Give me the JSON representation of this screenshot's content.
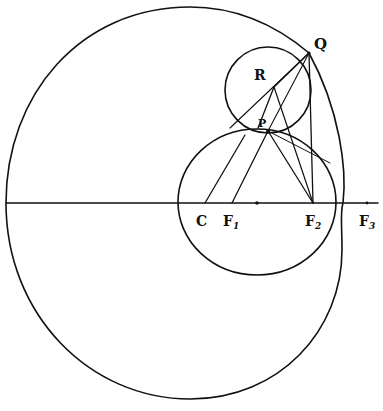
{
  "figure": {
    "type": "geometric construction",
    "stroke_color": "#111111",
    "background": "#ffffff"
  },
  "points": {
    "Q": {
      "label": "Q",
      "x": 309,
      "y": 53
    },
    "R": {
      "label": "R",
      "x": 262,
      "y": 76
    },
    "P": {
      "label": "P",
      "x": 268,
      "y": 131
    },
    "C": {
      "label": "C",
      "x": 205,
      "y": 203
    },
    "F1": {
      "label": "F",
      "sub": "1",
      "x": 232,
      "y": 203
    },
    "F2": {
      "label": "F",
      "sub": "2",
      "x": 313,
      "y": 203
    },
    "F3": {
      "label": "F",
      "sub": "3",
      "x": 367,
      "y": 203
    },
    "M": {
      "x": 257,
      "y": 203
    }
  },
  "labels": {
    "Q": "Q",
    "R": "R",
    "P": "P",
    "C": "C",
    "F": "F",
    "F1_sub": "1",
    "F2_sub": "2",
    "F3_sub": "3"
  },
  "curves": {
    "outer_oval": "limaçon-like closed curve through Q, tangent to small circle at Q",
    "mid_circle": {
      "cx": 257,
      "cy": 202,
      "r": 76
    },
    "small_circle": {
      "cx": 268,
      "cy": 89,
      "r": 43
    }
  },
  "axis": {
    "y": 203,
    "x_start": 6,
    "x_end": 378
  }
}
